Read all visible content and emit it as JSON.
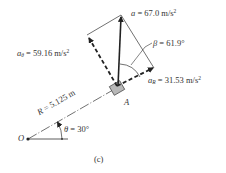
{
  "diagram": {
    "caption": "(c)",
    "labels": {
      "a": {
        "symbol": "a",
        "eq": " = ",
        "value": "67.0 m/s",
        "exp": "2"
      },
      "a_theta": {
        "symbol": "a",
        "sub": "θ",
        "eq": " = ",
        "value": "59.16 m/s",
        "exp": "2"
      },
      "a_R": {
        "symbol": "a",
        "sub": "R",
        "eq": " = ",
        "value": "31.53 m/s",
        "exp": "2"
      },
      "beta": {
        "symbol": "β",
        "eq": " = ",
        "value": "61.9°"
      },
      "R": {
        "symbol": "R",
        "eq": " = ",
        "value": "5.125 m"
      },
      "theta": {
        "symbol": "θ",
        "eq": " = ",
        "value": "30°"
      },
      "point_O": "O",
      "point_A": "A"
    },
    "colors": {
      "line": "#333333",
      "box_fill": "#b8b8b8",
      "box_stroke": "#444444"
    }
  }
}
